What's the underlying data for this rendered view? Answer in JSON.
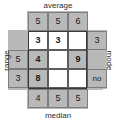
{
  "diagram": {
    "labels": {
      "top": "average",
      "bottom": "median",
      "left": "range",
      "right": "mode"
    },
    "colors": {
      "shaded": "#b9b9b9",
      "white": "#ffffff",
      "grid_line": "#5c5c5c",
      "text": "#1a1a1a"
    },
    "top_row": [
      "5",
      "5",
      "6"
    ],
    "bottom_row": [
      "4",
      "5",
      "5"
    ],
    "left_column": [
      "",
      "5",
      "3"
    ],
    "right_column": [
      "3",
      "",
      "no"
    ],
    "inner_grid": [
      [
        "3",
        "3",
        ""
      ],
      [
        "4",
        "",
        "9"
      ],
      [
        "8",
        "",
        ""
      ]
    ]
  }
}
